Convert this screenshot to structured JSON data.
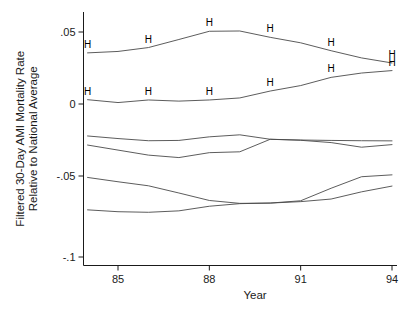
{
  "chart_data": {
    "type": "line",
    "title": "",
    "subtitle": "",
    "xlabel": "Year",
    "ylabel": "Filtered 30-Day AMI Mortality Rate Relative to National Average",
    "ylabel_line1": "Filtered 30-Day AMI Mortality Rate",
    "ylabel_line2": "Relative to National Average",
    "x": [
      1984,
      1985,
      1986,
      1987,
      1988,
      1989,
      1990,
      1991,
      1992,
      1993,
      1994
    ],
    "xtick_values": [
      85,
      88,
      91,
      94
    ],
    "xtick_labels": [
      "85",
      "88",
      "91",
      "94"
    ],
    "ytick_values": [
      0.05,
      0,
      -0.05,
      -0.1
    ],
    "ytick_labels": [
      ".05",
      "0",
      "-.05",
      "-.1"
    ],
    "xlim": [
      1983.6,
      1994.2
    ],
    "ylim": [
      -0.1,
      0.058
    ],
    "grid": false,
    "legend": null,
    "marker_label": "H",
    "marker_x": [
      1984,
      1986,
      1988,
      1990,
      1992,
      1994
    ],
    "line_color": "#4a4a4a",
    "axis_color": "#1a1a1a",
    "series": [
      {
        "name": "series-1-high-marked",
        "marked": true,
        "values": [
          0.0355,
          0.0365,
          0.0392,
          0.0448,
          0.0505,
          0.0507,
          0.0463,
          0.0425,
          0.037,
          0.032,
          0.0285
        ]
      },
      {
        "name": "series-2-marked",
        "marked": true,
        "values": [
          0.003,
          0.001,
          0.0028,
          0.002,
          0.0028,
          0.0042,
          0.009,
          0.0128,
          0.0185,
          0.0215,
          0.0232
        ]
      },
      {
        "name": "series-3",
        "marked": false,
        "values": [
          -0.0222,
          -0.024,
          -0.0255,
          -0.0253,
          -0.0228,
          -0.0214,
          -0.0245,
          -0.025,
          -0.0253,
          -0.0255,
          -0.0256
        ]
      },
      {
        "name": "series-4",
        "marked": false,
        "values": [
          -0.0285,
          -0.032,
          -0.0355,
          -0.0372,
          -0.0338,
          -0.0332,
          -0.0245,
          -0.0252,
          -0.0268,
          -0.03,
          -0.0282
        ]
      },
      {
        "name": "series-5",
        "marked": false,
        "values": [
          -0.051,
          -0.054,
          -0.0568,
          -0.0618,
          -0.067,
          -0.069,
          -0.0688,
          -0.0672,
          -0.0585,
          -0.0505,
          -0.0492
        ]
      },
      {
        "name": "series-6",
        "marked": false,
        "values": [
          -0.0735,
          -0.0748,
          -0.0752,
          -0.0742,
          -0.071,
          -0.0692,
          -0.0688,
          -0.0678,
          -0.066,
          -0.061,
          -0.057
        ]
      }
    ]
  }
}
